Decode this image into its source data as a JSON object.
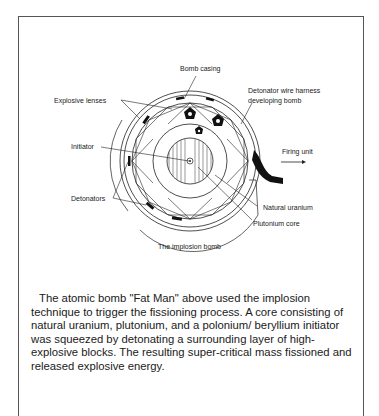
{
  "figure": {
    "title": "The implosion bomb",
    "labels": {
      "bomb_casing": "Bomb casing",
      "explosive_lenses": "Explosive lenses",
      "detonator_harness_line1": "Detonator wire harness",
      "detonator_harness_line2": "developing bomb",
      "initiator": "Initiator",
      "firing_unit": "Firing unit",
      "detonators": "Detonators",
      "natural_uranium": "Natural uranium",
      "plutonium_core": "Plutonium core"
    }
  },
  "description": {
    "text": "The atomic bomb \"Fat Man\" above used the implosion technique to trigger the fissioning process. A core consisting of natural uranium, plutonium, and a polonium/ beryllium initiator was squeezed by detonating a surrounding layer of high-explosive blocks. The resulting super-critical mass fissioned and released explosive energy."
  }
}
